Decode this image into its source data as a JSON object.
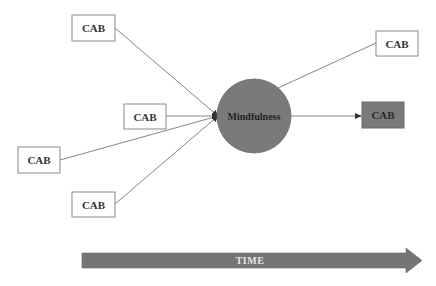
{
  "diagram": {
    "colors": {
      "node_fill": "#7a7a7a",
      "box_border": "#8a8a8a",
      "line": "#777777",
      "time_arrow": "#757575",
      "text": "#333333"
    },
    "input_boxes": [
      {
        "label": "CAB",
        "x": 72,
        "y": 15,
        "w": 43,
        "h": 26
      },
      {
        "label": "CAB",
        "x": 124,
        "y": 104,
        "w": 42,
        "h": 25
      },
      {
        "label": "CAB",
        "x": 18,
        "y": 147,
        "w": 42,
        "h": 26
      },
      {
        "label": "CAB",
        "x": 72,
        "y": 192,
        "w": 43,
        "h": 25
      }
    ],
    "center_node": {
      "label": "Mindfulness",
      "cx": 254,
      "cy": 116,
      "r": 37
    },
    "output_boxes": [
      {
        "label": "CAB",
        "x": 376,
        "y": 31,
        "w": 42,
        "h": 25,
        "filled": false
      },
      {
        "label": "CAB",
        "x": 362,
        "y": 102,
        "w": 42,
        "h": 26,
        "filled": true
      }
    ],
    "time_arrow": {
      "label": "TIME"
    }
  }
}
